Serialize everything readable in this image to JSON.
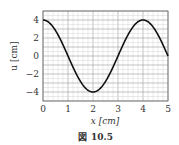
{
  "chart_data": {
    "type": "line",
    "title": "",
    "xlabel": "x [cm]",
    "ylabel": "u [cm]",
    "xlim": [
      0,
      5
    ],
    "ylim": [
      -5,
      5
    ],
    "xticks": [
      "0",
      "1",
      "2",
      "3",
      "4",
      "5"
    ],
    "yticks": [
      "4",
      "2",
      "0",
      "−2",
      "−4"
    ],
    "grid": true,
    "series": [
      {
        "name": "u(x)",
        "function": "4*cos(pi*x/2)",
        "x": [
          0,
          0.5,
          1,
          1.5,
          2,
          2.5,
          3,
          3.5,
          4,
          4.5,
          5
        ],
        "values": [
          4,
          2.83,
          0,
          -2.83,
          -4,
          -2.83,
          0,
          2.83,
          4,
          2.83,
          0
        ],
        "color": "#111111"
      }
    ]
  },
  "caption": {
    "icon": "figure-kanji",
    "symbol": "図",
    "number": "10.5"
  }
}
